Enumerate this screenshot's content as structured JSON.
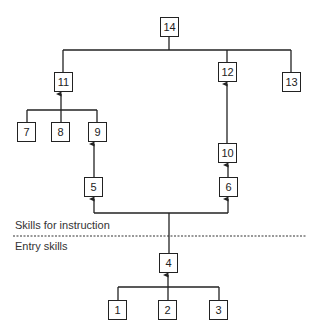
{
  "diagram": {
    "type": "learning-hierarchy",
    "section_labels": {
      "upper": "Skills for instruction",
      "lower": "Entry skills"
    },
    "nodes": [
      {
        "id": "14",
        "label": "14"
      },
      {
        "id": "11",
        "label": "11"
      },
      {
        "id": "12",
        "label": "12"
      },
      {
        "id": "13",
        "label": "13"
      },
      {
        "id": "7",
        "label": "7"
      },
      {
        "id": "8",
        "label": "8"
      },
      {
        "id": "9",
        "label": "9"
      },
      {
        "id": "10",
        "label": "10"
      },
      {
        "id": "5",
        "label": "5"
      },
      {
        "id": "6",
        "label": "6"
      },
      {
        "id": "4",
        "label": "4"
      },
      {
        "id": "1",
        "label": "1"
      },
      {
        "id": "2",
        "label": "2"
      },
      {
        "id": "3",
        "label": "3"
      }
    ],
    "edges": [
      {
        "from": "11",
        "to": "14"
      },
      {
        "from": "12",
        "to": "14"
      },
      {
        "from": "13",
        "to": "14"
      },
      {
        "from": "7",
        "to": "11"
      },
      {
        "from": "8",
        "to": "11"
      },
      {
        "from": "9",
        "to": "11"
      },
      {
        "from": "5",
        "to": "9"
      },
      {
        "from": "10",
        "to": "12"
      },
      {
        "from": "6",
        "to": "10"
      },
      {
        "from": "4",
        "to": "5"
      },
      {
        "from": "4",
        "to": "6"
      },
      {
        "from": "1",
        "to": "4"
      },
      {
        "from": "2",
        "to": "4"
      },
      {
        "from": "3",
        "to": "4"
      }
    ],
    "colors": {
      "line": "#222222",
      "text": "#333333",
      "background": "#ffffff"
    }
  }
}
